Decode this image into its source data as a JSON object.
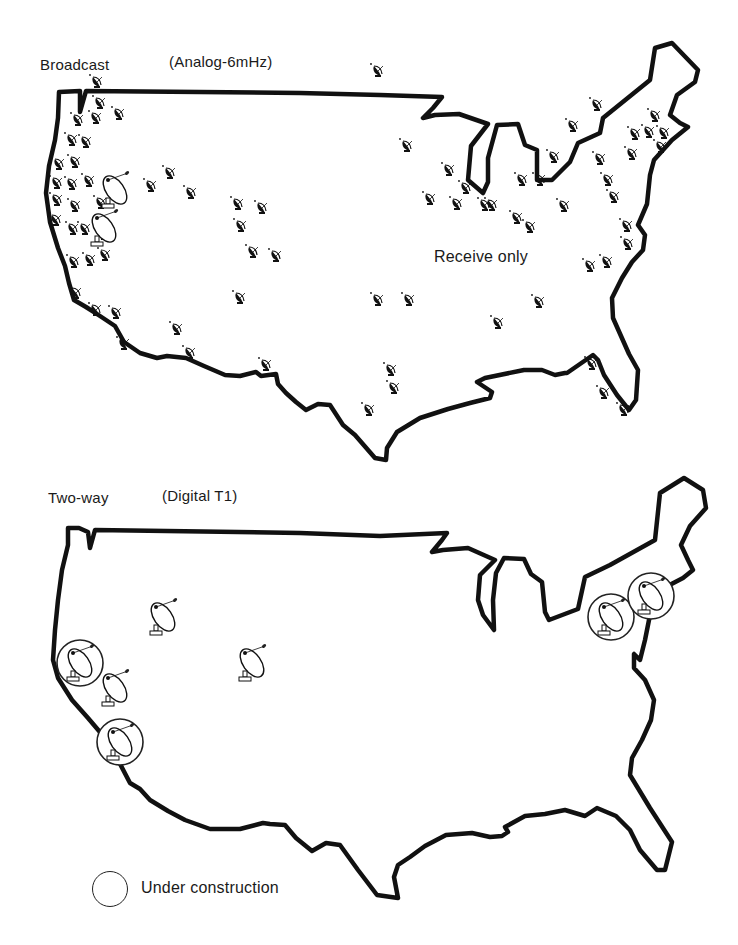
{
  "top_map": {
    "title": "Broadcast",
    "subtitle": "(Analog-6mHz)",
    "annotation": "Receive only",
    "small_dish_count": 94,
    "small_dishes": [
      [
        97,
        82
      ],
      [
        100,
        103
      ],
      [
        119,
        114
      ],
      [
        78,
        120
      ],
      [
        96,
        118
      ],
      [
        72,
        140
      ],
      [
        86,
        142
      ],
      [
        59,
        164
      ],
      [
        75,
        162
      ],
      [
        57,
        183
      ],
      [
        72,
        184
      ],
      [
        89,
        181
      ],
      [
        57,
        200
      ],
      [
        75,
        206
      ],
      [
        101,
        203
      ],
      [
        56,
        220
      ],
      [
        73,
        229
      ],
      [
        85,
        229
      ],
      [
        104,
        234
      ],
      [
        151,
        186
      ],
      [
        170,
        173
      ],
      [
        191,
        193
      ],
      [
        238,
        204
      ],
      [
        262,
        208
      ],
      [
        241,
        226
      ],
      [
        253,
        252
      ],
      [
        276,
        256
      ],
      [
        74,
        262
      ],
      [
        90,
        260
      ],
      [
        105,
        255
      ],
      [
        76,
        293
      ],
      [
        96,
        310
      ],
      [
        116,
        313
      ],
      [
        124,
        344
      ],
      [
        177,
        329
      ],
      [
        190,
        353
      ],
      [
        240,
        298
      ],
      [
        266,
        365
      ],
      [
        378,
        300
      ],
      [
        409,
        300
      ],
      [
        391,
        370
      ],
      [
        394,
        388
      ],
      [
        369,
        410
      ],
      [
        498,
        323
      ],
      [
        539,
        302
      ],
      [
        407,
        146
      ],
      [
        449,
        170
      ],
      [
        466,
        188
      ],
      [
        430,
        199
      ],
      [
        457,
        204
      ],
      [
        492,
        205
      ],
      [
        517,
        218
      ],
      [
        530,
        227
      ],
      [
        378,
        71
      ],
      [
        554,
        157
      ],
      [
        573,
        126
      ],
      [
        522,
        180
      ],
      [
        564,
        206
      ],
      [
        597,
        105
      ],
      [
        600,
        159
      ],
      [
        608,
        180
      ],
      [
        614,
        197
      ],
      [
        627,
        226
      ],
      [
        628,
        244
      ],
      [
        632,
        154
      ],
      [
        635,
        134
      ],
      [
        649,
        132
      ],
      [
        655,
        116
      ],
      [
        664,
        133
      ],
      [
        661,
        147
      ],
      [
        590,
        266
      ],
      [
        607,
        262
      ],
      [
        592,
        364
      ],
      [
        604,
        393
      ],
      [
        624,
        410
      ],
      [
        485,
        205
      ],
      [
        540,
        180
      ]
    ],
    "large_dishes": [
      [
        115,
        190
      ],
      [
        104,
        228
      ]
    ]
  },
  "bottom_map": {
    "title": "Two-way",
    "subtitle": "(Digital T1)",
    "dishes": [
      {
        "x": 163,
        "y": 617,
        "circled": false
      },
      {
        "x": 252,
        "y": 663,
        "circled": false
      },
      {
        "x": 80,
        "y": 663,
        "circled": true
      },
      {
        "x": 115,
        "y": 688,
        "circled": false
      },
      {
        "x": 120,
        "y": 742,
        "circled": true
      },
      {
        "x": 611,
        "y": 617,
        "circled": true
      },
      {
        "x": 651,
        "y": 596,
        "circled": true
      }
    ]
  },
  "legend": {
    "label": "Under construction"
  }
}
